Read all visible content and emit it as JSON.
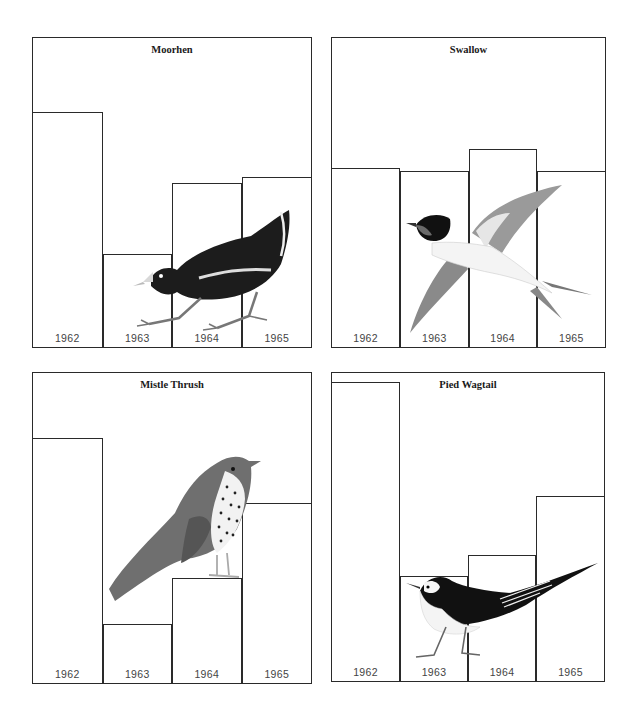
{
  "chart_data": [
    {
      "type": "bar",
      "title": "Moorhen",
      "categories": [
        "1962",
        "1963",
        "1964",
        "1965"
      ],
      "values": [
        76,
        30,
        53,
        55
      ],
      "xlabel": "",
      "ylabel": "",
      "ylim": [
        0,
        100
      ],
      "grid": false,
      "illustration": "moorhen"
    },
    {
      "type": "bar",
      "title": "Swallow",
      "categories": [
        "1962",
        "1963",
        "1964",
        "1965"
      ],
      "values": [
        58,
        57,
        64,
        57
      ],
      "xlabel": "",
      "ylabel": "",
      "ylim": [
        0,
        100
      ],
      "grid": false,
      "illustration": "swallow"
    },
    {
      "type": "bar",
      "title": "Mistle Thrush",
      "categories": [
        "1962",
        "1963",
        "1964",
        "1965"
      ],
      "values": [
        79,
        19,
        34,
        58
      ],
      "xlabel": "",
      "ylabel": "",
      "ylim": [
        0,
        100
      ],
      "grid": false,
      "illustration": "mistle-thrush"
    },
    {
      "type": "bar",
      "title": "Pied Wagtail",
      "categories": [
        "1962",
        "1963",
        "1964",
        "1965"
      ],
      "values": [
        97,
        34,
        41,
        60
      ],
      "xlabel": "",
      "ylabel": "",
      "ylim": [
        0,
        100
      ],
      "grid": false,
      "illustration": "pied-wagtail"
    }
  ],
  "colors": {
    "frame": "#2a2a2a",
    "label": "#444444"
  }
}
